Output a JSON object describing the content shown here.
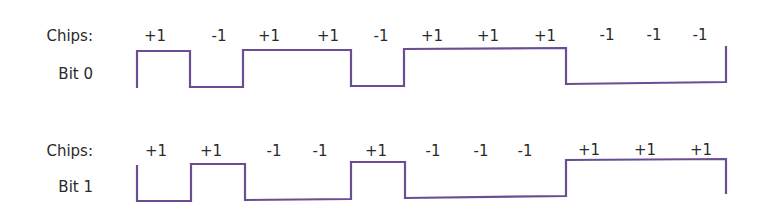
{
  "diagram": {
    "rows": [
      {
        "chips_label": "Chips:",
        "bit_label": "Bit 0",
        "chips": [
          "+1",
          "-1",
          "+1",
          "+1",
          "-1",
          "+1",
          "+1",
          "+1",
          "-1",
          "-1",
          "-1"
        ],
        "chip_x": [
          155,
          219,
          269,
          328,
          381,
          432,
          488,
          545,
          607,
          654,
          700
        ]
      },
      {
        "chips_label": "Chips:",
        "bit_label": "Bit 1",
        "chips": [
          "+1",
          "+1",
          "-1",
          "-1",
          "+1",
          "-1",
          "-1",
          "-1",
          "+1",
          "+1",
          "+1"
        ],
        "chip_x": [
          155,
          210,
          273,
          320,
          376,
          432,
          481,
          524,
          589,
          645,
          700
        ]
      }
    ],
    "line_color": "#6a4d93"
  }
}
